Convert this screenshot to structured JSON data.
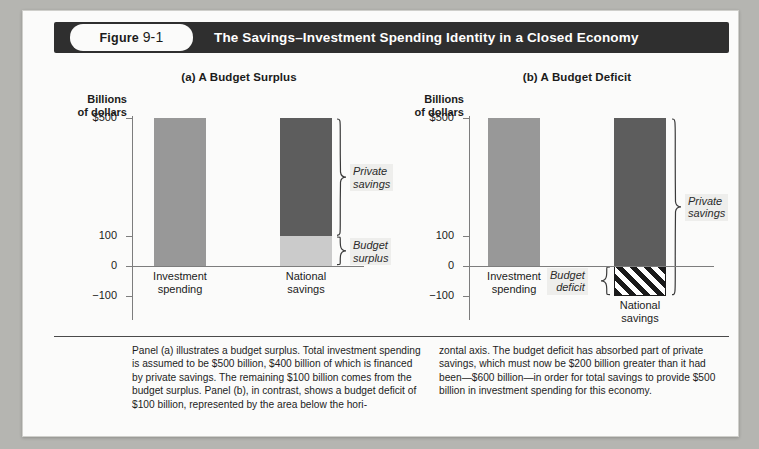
{
  "header": {
    "figure_word": "Figure",
    "figure_number": "9-1",
    "title": "The Savings–Investment Spending Identity in a Closed Economy"
  },
  "chart_data": {
    "type": "bar",
    "title": "The Savings–Investment Spending Identity in a Closed Economy",
    "ylabel": "Billions of dollars",
    "ylim": [
      -100,
      560
    ],
    "yticks": [
      "$500",
      "100",
      "0",
      "−100"
    ],
    "ytick_values": [
      500,
      100,
      0,
      -100
    ],
    "grid": false,
    "panels": [
      {
        "key": "a",
        "title": "(a) A Budget Surplus",
        "axis_unit_line1": "Billions",
        "axis_unit_line2": "of dollars",
        "categories": [
          "Investment spending",
          "National savings"
        ],
        "bars": [
          {
            "label_line1": "Investment",
            "label_line2": "spending",
            "segments": [
              {
                "name": "investment-spending",
                "from": 0,
                "to": 500,
                "color": "#989898",
                "hatch": false
              }
            ]
          },
          {
            "label_line1": "National",
            "label_line2": "savings",
            "segments": [
              {
                "name": "private-savings",
                "from": 100,
                "to": 500,
                "color": "#5d5d5d",
                "hatch": false
              },
              {
                "name": "budget-surplus",
                "from": 0,
                "to": 100,
                "color": "#cbcbcb",
                "hatch": false
              }
            ]
          }
        ],
        "annotations": [
          {
            "name": "private-savings",
            "line1": "Private",
            "line2": "savings",
            "from": 100,
            "to": 500
          },
          {
            "name": "budget-surplus",
            "line1": "Budget",
            "line2": "surplus",
            "from": 0,
            "to": 100
          }
        ]
      },
      {
        "key": "b",
        "title": "(b) A Budget Deficit",
        "axis_unit_line1": "Billions",
        "axis_unit_line2": "of dollars",
        "categories": [
          "Investment spending",
          "National savings"
        ],
        "bars": [
          {
            "label_line1": "Investment",
            "label_line2": "spending",
            "segments": [
              {
                "name": "investment-spending",
                "from": 0,
                "to": 500,
                "color": "#989898",
                "hatch": false
              }
            ]
          },
          {
            "label_line1": "National",
            "label_line2": "savings",
            "segments": [
              {
                "name": "private-savings",
                "from": 0,
                "to": 500,
                "color": "#5d5d5d",
                "hatch": false
              },
              {
                "name": "budget-deficit",
                "from": -100,
                "to": 0,
                "color": "#ffffff",
                "hatch": true
              }
            ]
          }
        ],
        "annotations": [
          {
            "name": "private-savings",
            "line1": "Private",
            "line2": "savings",
            "from": -100,
            "to": 500
          },
          {
            "name": "budget-deficit",
            "line1": "Budget",
            "line2": "deficit",
            "from": -100,
            "to": 0
          }
        ]
      }
    ],
    "colors": {
      "investment": "#989898",
      "private_savings": "#5d5d5d",
      "budget_surplus": "#cbcbcb",
      "budget_deficit_hatch": "#1a1a1a",
      "axis": "#7d7d7d",
      "header_bg": "#2f2f2f"
    }
  },
  "caption": {
    "left": "Panel (a) illustrates a budget surplus. Total investment spending is assumed to be $500 billion, $400 billion of which is financed by private savings. The remaining $100 billion comes from the budget surplus. Panel (b), in contrast, shows a budget deficit of $100 billion, represented by the area below the hori-",
    "right": "zontal axis. The budget deficit has absorbed part of private savings, which must now be $200 billion greater than it had been—$600 billion—in order for total savings to provide $500 billion in investment spending for this economy."
  }
}
